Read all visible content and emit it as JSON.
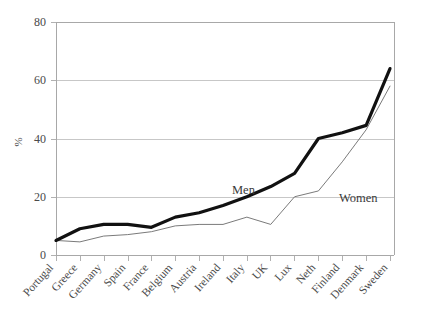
{
  "chart_data": {
    "type": "line",
    "title": "",
    "xlabel": "",
    "ylabel": "%",
    "ylim": [
      0,
      80
    ],
    "yticks": [
      0,
      20,
      40,
      60,
      80
    ],
    "grid": "horizontal",
    "legend_position": "inline-annotation",
    "categories": [
      "Portugal",
      "Greece",
      "Germany",
      "Spain",
      "France",
      "Belgium",
      "Austria",
      "Ireland",
      "Italy",
      "UK",
      "Lux",
      "Neth",
      "Finland",
      "Denmark",
      "Sweden"
    ],
    "series": [
      {
        "name": "Men",
        "values": [
          5,
          9,
          10.5,
          10.5,
          9.5,
          13,
          14.5,
          17,
          20,
          23.5,
          28,
          40,
          42,
          44.5,
          64
        ]
      },
      {
        "name": "Women",
        "values": [
          5,
          4.5,
          6.5,
          7,
          8,
          10,
          10.5,
          10.5,
          13,
          10.5,
          20,
          22,
          32,
          43,
          58
        ]
      }
    ],
    "annotations": [
      {
        "text": "Men",
        "category": "Ireland",
        "value": 21.5
      },
      {
        "text": "Women",
        "category": "Neth",
        "value": 19.5
      }
    ]
  },
  "axis": {
    "ylabel": "%",
    "ytick_labels": [
      "0",
      "20",
      "40",
      "60",
      "80"
    ]
  },
  "annotation_labels": {
    "men": "Men",
    "women": "Women"
  }
}
